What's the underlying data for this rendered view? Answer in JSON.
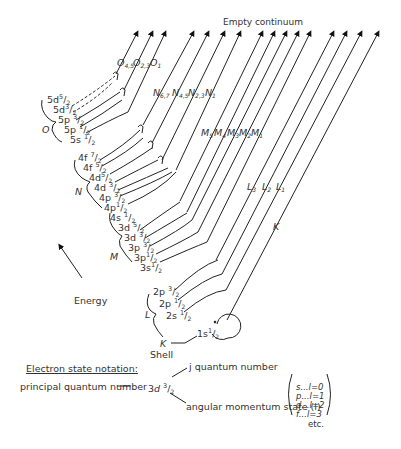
{
  "title": "Empty continuum",
  "axis": {
    "energy_label": "Energy"
  },
  "shells": [
    {
      "name": "O",
      "subshells": [
        {
          "n": "5",
          "l": "d",
          "j_num": "5",
          "j_den": "2"
        },
        {
          "n": "5",
          "l": "d",
          "j_num": "3",
          "j_den": "2"
        },
        {
          "n": "5",
          "l": "p",
          "j_num": "3",
          "j_den": "2"
        },
        {
          "n": "5",
          "l": "p",
          "j_num": "1",
          "j_den": "2"
        },
        {
          "n": "5",
          "l": "s",
          "j_num": "1",
          "j_den": "2"
        }
      ],
      "edges": [
        {
          "main": "O",
          "sub": "4,5"
        },
        {
          "main": "O",
          "sub": "2,3"
        },
        {
          "main": "O",
          "sub": "1"
        }
      ]
    },
    {
      "name": "N",
      "subshells": [
        {
          "n": "4",
          "l": "f",
          "j_num": "7",
          "j_den": "2"
        },
        {
          "n": "4",
          "l": "f",
          "j_num": "5",
          "j_den": "2"
        },
        {
          "n": "4",
          "l": "d",
          "j_num": "5",
          "j_den": "2"
        },
        {
          "n": "4",
          "l": "d",
          "j_num": "3",
          "j_den": "2"
        },
        {
          "n": "4",
          "l": "p",
          "j_num": "3",
          "j_den": "2"
        },
        {
          "n": "4",
          "l": "p",
          "j_num": "1",
          "j_den": "2"
        },
        {
          "n": "4",
          "l": "s",
          "j_num": "1",
          "j_den": "2"
        }
      ],
      "edges": [
        {
          "main": "N",
          "sub": "6,7"
        },
        {
          "main": "N",
          "sub": "4,5"
        },
        {
          "main": "N",
          "sub": "2,3"
        },
        {
          "main": "N",
          "sub": "1"
        }
      ]
    },
    {
      "name": "M",
      "subshells": [
        {
          "n": "3",
          "l": "d",
          "j_num": "5",
          "j_den": "2"
        },
        {
          "n": "3",
          "l": "d",
          "j_num": "3",
          "j_den": "2"
        },
        {
          "n": "3",
          "l": "p",
          "j_num": "3",
          "j_den": "2"
        },
        {
          "n": "3",
          "l": "p",
          "j_num": "1",
          "j_den": "2"
        },
        {
          "n": "3",
          "l": "s",
          "j_num": "1",
          "j_den": "2"
        }
      ],
      "edges": [
        {
          "main": "M",
          "sub": "5"
        },
        {
          "main": "M",
          "sub": "4"
        },
        {
          "main": "M",
          "sub": "3"
        },
        {
          "main": "M",
          "sub": "2"
        },
        {
          "main": "M",
          "sub": "1"
        }
      ]
    },
    {
      "name": "L",
      "subshells": [
        {
          "n": "2",
          "l": "p",
          "j_num": "3",
          "j_den": "2"
        },
        {
          "n": "2",
          "l": "p",
          "j_num": "1",
          "j_den": "2"
        },
        {
          "n": "2",
          "l": "s",
          "j_num": "1",
          "j_den": "2"
        }
      ],
      "edges": [
        {
          "main": "L",
          "sub": "3"
        },
        {
          "main": "L",
          "sub": "2"
        },
        {
          "main": "L",
          "sub": "1"
        }
      ]
    },
    {
      "name": "K",
      "subshells": [
        {
          "n": "1",
          "l": "s",
          "j_num": "1",
          "j_den": "2"
        }
      ],
      "edges": [
        {
          "main": "K",
          "sub": ""
        }
      ]
    }
  ],
  "k_shell_callout": {
    "letter": "K",
    "word": "Shell"
  },
  "notation": {
    "heading": "Electron state notation:",
    "principal_label": "principal quantum number",
    "example": {
      "n": "3",
      "l": "d",
      "j_num": "3",
      "j_den": "2"
    },
    "j_label": "j quantum number",
    "angular_label": "angular momentum state (l)",
    "l_values": [
      {
        "letter": "s",
        "value": "l=0"
      },
      {
        "letter": "p",
        "value": "l=1"
      },
      {
        "letter": "d",
        "value": "l=2"
      },
      {
        "letter": "f",
        "value": "l=3"
      }
    ],
    "etc": "etc."
  }
}
